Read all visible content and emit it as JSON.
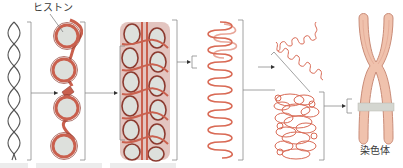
{
  "diagram": {
    "labels": {
      "histone": "ヒストン",
      "chromosome": "染色体"
    },
    "stages": [
      {
        "id": "double-helix",
        "name": "DNA double helix"
      },
      {
        "id": "nucleosome-string",
        "name": "Nucleosomes (DNA wrapped on histones)"
      },
      {
        "id": "chromatin-fiber",
        "name": "Condensed chromatin fiber"
      },
      {
        "id": "looped-fiber",
        "name": "Looped fiber"
      },
      {
        "id": "coiled-domain",
        "name": "Supercoiled domain"
      },
      {
        "id": "chromosome",
        "name": "Metaphase chromosome"
      }
    ],
    "colors": {
      "dna_strand": "#555555",
      "chromatin": "#c9604e",
      "chromatin_dark": "#8c3b30",
      "histone": "#dde0dc",
      "fiber_line": "#d96a55",
      "chromosome_fill": "#f0c2ad",
      "chromosome_edge": "#c98c78",
      "band": "#d4d6d0",
      "bracket": "#8a8a8a",
      "label_text": "#3a3a3a"
    }
  }
}
